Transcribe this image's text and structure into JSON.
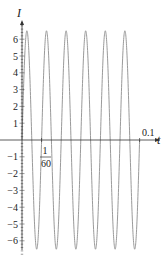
{
  "chart_data": {
    "type": "line",
    "title": "",
    "xlabel": "t",
    "ylabel": "I",
    "function": "I = 6.5 sin(120πt)",
    "amplitude": 6.5,
    "frequency_hz": 60,
    "period": 0.016667,
    "x_range": [
      0,
      0.1
    ],
    "ylim": [
      -7,
      7
    ],
    "x_tick_labels": [
      "1/60",
      "0.1"
    ],
    "x_ticks": [
      0.016667,
      0.1
    ],
    "y_ticks": [
      -6,
      -5,
      -4,
      -3,
      -2,
      -1,
      1,
      2,
      3,
      4,
      5,
      6
    ],
    "y_tick_labels": [
      "-6",
      "-5",
      "-4",
      "-3",
      "-2",
      "-1",
      "1",
      "2",
      "3",
      "4",
      "5",
      "6"
    ],
    "grid": false,
    "legend": null,
    "series": [
      {
        "name": "I(t)",
        "color": "#9a9a9a",
        "cycles": 6
      }
    ]
  },
  "labels": {
    "y_axis": "I",
    "x_axis": "t",
    "x_tick_frac_num": "1",
    "x_tick_frac_den": "60",
    "x_tick_end": "0.1"
  },
  "colors": {
    "axis": "#333333",
    "curve": "#9a9a9a"
  }
}
